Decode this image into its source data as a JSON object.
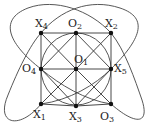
{
  "nodes": [
    {
      "id": "X4",
      "base": "X",
      "sub": "4",
      "x": 41,
      "y": 33,
      "lx": 35,
      "ly": 18
    },
    {
      "id": "O2",
      "base": "O",
      "sub": "2",
      "x": 76,
      "y": 33,
      "lx": 68,
      "ly": 18
    },
    {
      "id": "X2",
      "base": "X",
      "sub": "2",
      "x": 111,
      "y": 33,
      "lx": 105,
      "ly": 18
    },
    {
      "id": "O4",
      "base": "O",
      "sub": "4",
      "x": 41,
      "y": 69,
      "lx": 22,
      "ly": 63
    },
    {
      "id": "O1",
      "base": "O",
      "sub": "1",
      "x": 76,
      "y": 69,
      "lx": 74,
      "ly": 54
    },
    {
      "id": "X5",
      "base": "X",
      "sub": "5",
      "x": 111,
      "y": 69,
      "lx": 114,
      "ly": 63
    },
    {
      "id": "X1",
      "base": "X",
      "sub": "1",
      "x": 41,
      "y": 104,
      "lx": 33,
      "ly": 109
    },
    {
      "id": "X3",
      "base": "X",
      "sub": "3",
      "x": 76,
      "y": 106,
      "lx": 69,
      "ly": 111
    },
    {
      "id": "O3",
      "base": "O",
      "sub": "3",
      "x": 111,
      "y": 104,
      "lx": 100,
      "ly": 111
    }
  ],
  "edges": [
    [
      "X4",
      "O2"
    ],
    [
      "O2",
      "X2"
    ],
    [
      "X2",
      "X5"
    ],
    [
      "X5",
      "O3"
    ],
    [
      "O3",
      "X3"
    ],
    [
      "X3",
      "X1"
    ],
    [
      "X1",
      "O4"
    ],
    [
      "O4",
      "X4"
    ],
    [
      "O2",
      "O1"
    ],
    [
      "O1",
      "X3"
    ],
    [
      "O4",
      "O1"
    ],
    [
      "O1",
      "X5"
    ],
    [
      "X4",
      "O1"
    ],
    [
      "O1",
      "O3"
    ],
    [
      "X2",
      "O1"
    ],
    [
      "O1",
      "X1"
    ],
    [
      "O2",
      "O4"
    ],
    [
      "O4",
      "X3"
    ],
    [
      "X3",
      "X5"
    ],
    [
      "X5",
      "O2"
    ]
  ],
  "colors": {
    "stroke": "#333333",
    "node": "#111111"
  }
}
